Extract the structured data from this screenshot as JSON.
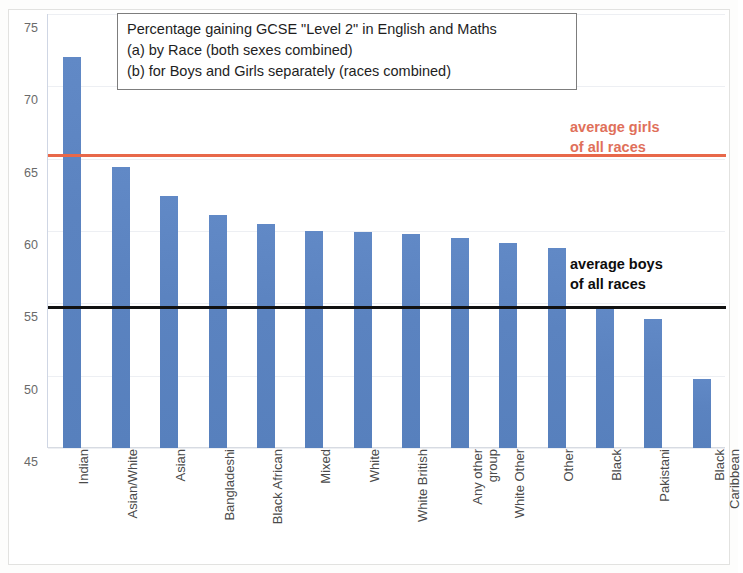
{
  "chart_data": {
    "type": "bar",
    "title": "Percentage gaining GCSE \"Level 2\" in English and Maths",
    "title_lines": [
      "Percentage gaining GCSE \"Level 2\" in English and Maths",
      "(a) by Race (both sexes combined)",
      "(b) for Boys and Girls separately (races combined)"
    ],
    "xlabel": "",
    "ylabel": "",
    "ylim": [
      45,
      75
    ],
    "ytick_labels": [
      "45",
      "50",
      "55",
      "60",
      "65",
      "70",
      "75"
    ],
    "yticks": [
      45,
      50,
      55,
      60,
      65,
      70,
      75
    ],
    "grid": true,
    "legend_position": "none",
    "bar_color": "#5b83c0",
    "categories": [
      "Indian",
      "Asian/White",
      "Asian",
      "Bangladeshi",
      "Black African",
      "Mixed",
      "White",
      "White British",
      "Any other\ngroup",
      "White Other",
      "Other",
      "Black",
      "Pakistani",
      "Black\nCaribbean"
    ],
    "values": [
      72.0,
      64.4,
      62.4,
      61.1,
      60.5,
      60.0,
      59.9,
      59.8,
      59.5,
      59.2,
      58.8,
      54.8,
      53.9,
      49.8
    ],
    "reference_lines": [
      {
        "name": "average girls of all races",
        "label": "average girls\nof all races",
        "value": 65.3,
        "color": "#e8684a",
        "text_color": "#e0705a"
      },
      {
        "name": "average boys of all races",
        "label": "average boys\nof all races",
        "value": 54.8,
        "color": "#111111",
        "text_color": "#0d0d0d"
      }
    ]
  }
}
